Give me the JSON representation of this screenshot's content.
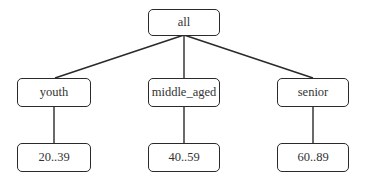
{
  "diagram": {
    "type": "concept-hierarchy-tree",
    "root": {
      "label": "all"
    },
    "level1": [
      {
        "label": "youth"
      },
      {
        "label": "middle_aged"
      },
      {
        "label": "senior"
      }
    ],
    "level2": [
      {
        "label": "20..39",
        "parent": "youth"
      },
      {
        "label": "40..59",
        "parent": "middle_aged"
      },
      {
        "label": "60..89",
        "parent": "senior"
      }
    ],
    "edges": [
      {
        "from": "all",
        "to": "youth"
      },
      {
        "from": "all",
        "to": "middle_aged"
      },
      {
        "from": "all",
        "to": "senior"
      },
      {
        "from": "youth",
        "to": "20..39"
      },
      {
        "from": "middle_aged",
        "to": "40..59"
      },
      {
        "from": "senior",
        "to": "60..89"
      }
    ],
    "colors": {
      "line": "#2a2a2a",
      "text": "#333333",
      "background": "#ffffff"
    }
  }
}
